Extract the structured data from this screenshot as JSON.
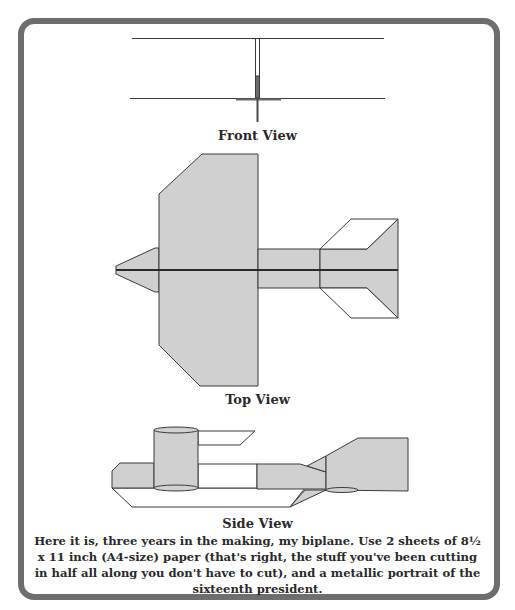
{
  "figure": {
    "views": [
      {
        "id": "front",
        "label": "Front View"
      },
      {
        "id": "top",
        "label": "Top View"
      },
      {
        "id": "side",
        "label": "Side View"
      }
    ],
    "caption": "Here it is, three years in the making, my biplane. Use 2 sheets of 8½ x 11 inch (A4-size) paper (that's right, the stuff you've been cutting in half all along you don't have to cut), and a metallic portrait of the sixteenth president.",
    "colors": {
      "border": "#6e6e6e",
      "fill": "#d0d0d0",
      "stroke": "#3a3a3a",
      "text": "#2a2a2a"
    }
  }
}
